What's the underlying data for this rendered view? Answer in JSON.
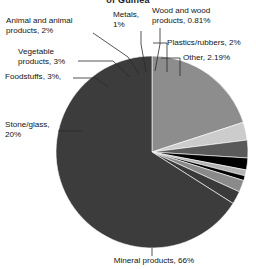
{
  "chart_data": {
    "type": "pie",
    "title": "of Guinea",
    "categories": [
      "Mineral products",
      "Stone/glass",
      "Foodstuffs",
      "Vegetable products",
      "Animal and animal products",
      "Metals",
      "Wood and wood products",
      "Plastics/rubbers",
      "Other"
    ],
    "values": [
      66,
      20,
      3,
      3,
      2,
      1,
      0.81,
      2,
      2.19
    ],
    "value_labels": [
      "66%",
      "20%",
      "3%",
      "3%",
      "2%",
      "1%",
      "0.81%",
      "2%",
      "2.19%"
    ],
    "colors": [
      "#3c3c3c",
      "#8d8d8d",
      "#cccccc",
      "#5a5a5a",
      "#000000",
      "#b4b4b4",
      "#000000",
      "#8a8a8a",
      "#3a3a3a"
    ],
    "legend": "none",
    "grid": false,
    "xlabel": "",
    "ylabel": "",
    "units": "percent"
  },
  "labels": {
    "animal": "Animal and animal\nproducts, 2%",
    "vegetable": "Vegetable\nproducts, 3%",
    "foodstuffs": "Foodstuffs, 3%,",
    "stone_glass": "Stone/glass,\n20%",
    "metals": "Metals,\n1%",
    "wood": "Wood and wood\nproducts, 0.81%",
    "plastics": "Plastics/rubbers, 2%",
    "other": "Other, 2.19%",
    "mineral": "Mineral products, 66%"
  }
}
